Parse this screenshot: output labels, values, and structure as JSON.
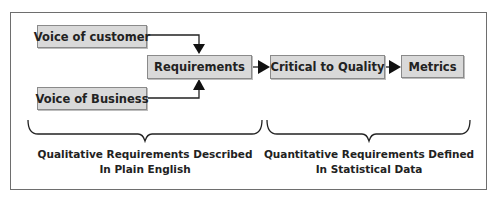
{
  "diagram": {
    "boxes": {
      "voice_of_customer": "Voice of customer",
      "voice_of_business": "Voice of Business",
      "requirements": "Requirements",
      "critical_to_quality": "Critical to Quality",
      "metrics": "Metrics"
    },
    "captions": {
      "left_line1": "Qualitative Requirements Described",
      "left_line2": "In Plain English",
      "right_line1": "Quantitative Requirements Defined",
      "right_line2": "In Statistical Data"
    },
    "colors": {
      "box_fill": "#d9d9d9",
      "box_border": "#8a8a8a",
      "line": "#222222",
      "frame": "#6e6e6e"
    }
  }
}
